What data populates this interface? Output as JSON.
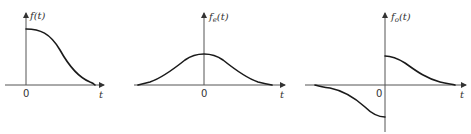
{
  "figure": {
    "panels": [
      {
        "name": "f",
        "ylabel": "f(t)",
        "ylabel_main": "f",
        "ylabel_sub": "",
        "ylabel_arg": "(t)",
        "xlabel": "t",
        "origin_label": "0",
        "description": "Causal function: zero for t<0, starts at maximum at t=0, decays smoothly to zero"
      },
      {
        "name": "fe",
        "ylabel": "f_e(t)",
        "ylabel_main": "f",
        "ylabel_sub": "e",
        "ylabel_arg": "(t)",
        "xlabel": "t",
        "origin_label": "0",
        "description": "Even part: symmetric bell-shaped curve, half the height of f(0) at t=0"
      },
      {
        "name": "fo",
        "ylabel": "f_o(t)",
        "ylabel_main": "f",
        "ylabel_sub": "o",
        "ylabel_arg": "(t)",
        "xlabel": "t",
        "origin_label": "0",
        "description": "Odd part: antisymmetric, positive half-height decay for t>0, negative mirror for t<0, discontinuous at t=0"
      }
    ],
    "colors": {
      "axis": "#555555",
      "curve": "#1a1a1a",
      "text": "#333333",
      "background": "#ffffff"
    }
  }
}
